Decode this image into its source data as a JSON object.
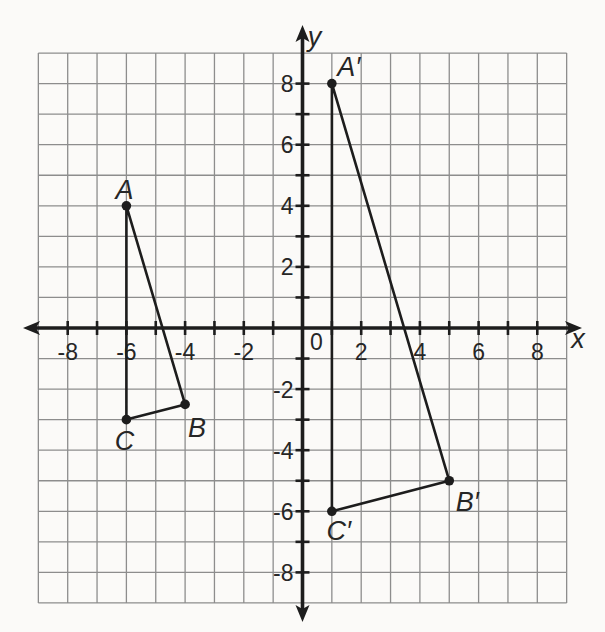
{
  "figure": {
    "background_color": "#fbfaf8",
    "grid_color": "#8d8d8d",
    "axis_color": "#1d1d1d",
    "shape_color": "#1d1d1d",
    "text_color": "#262626"
  },
  "chart_data": {
    "type": "line",
    "title": "",
    "xlabel": "x",
    "ylabel": "y",
    "origin_label": "0",
    "xlim": [
      -9,
      9
    ],
    "ylim": [
      -9,
      9
    ],
    "grid": true,
    "tick_step": 1,
    "x_tick_labels": [
      {
        "value": -8,
        "text": "-8"
      },
      {
        "value": -6,
        "text": "-6"
      },
      {
        "value": -4,
        "text": "-4"
      },
      {
        "value": -2,
        "text": "-2"
      },
      {
        "value": 2,
        "text": "2"
      },
      {
        "value": 4,
        "text": "4"
      },
      {
        "value": 6,
        "text": "6"
      },
      {
        "value": 8,
        "text": "8"
      }
    ],
    "y_tick_labels": [
      {
        "value": 8,
        "text": "8"
      },
      {
        "value": 6,
        "text": "6"
      },
      {
        "value": 4,
        "text": "4"
      },
      {
        "value": 2,
        "text": "2"
      },
      {
        "value": -2,
        "text": "-2"
      },
      {
        "value": -4,
        "text": "-4"
      },
      {
        "value": -6,
        "text": "-6"
      },
      {
        "value": -8,
        "text": "-8"
      }
    ],
    "series": [
      {
        "name": "triangle ABC",
        "closed": true,
        "points": [
          {
            "label": "A",
            "x": -6,
            "y": 4,
            "label_offset": [
              -2,
              -7
            ]
          },
          {
            "label": "B",
            "x": -4,
            "y": -2.5,
            "label_offset": [
              12,
              33
            ]
          },
          {
            "label": "C",
            "x": -6,
            "y": -3,
            "label_offset": [
              -2,
              30
            ]
          }
        ]
      },
      {
        "name": "triangle A′B′C′",
        "closed": true,
        "points": [
          {
            "label": "A′",
            "x": 1,
            "y": 8,
            "label_offset": [
              17,
              -8
            ]
          },
          {
            "label": "B′",
            "x": 5,
            "y": -5,
            "label_offset": [
              18,
              30
            ]
          },
          {
            "label": "C′",
            "x": 1,
            "y": -6,
            "label_offset": [
              7,
              29
            ]
          }
        ]
      }
    ]
  }
}
